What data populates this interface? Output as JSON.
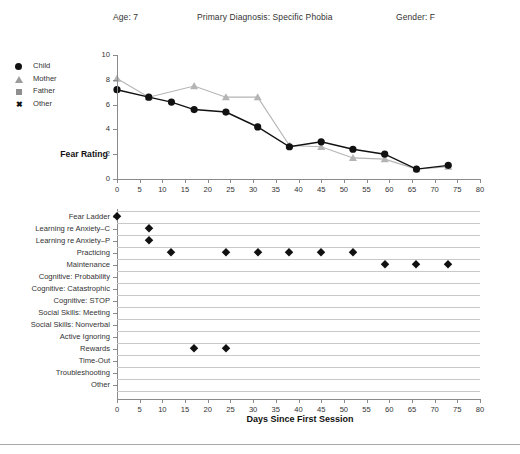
{
  "header": {
    "age": "Age:  7",
    "diagnosis": "Primary Diagnosis:  Specific Phobia",
    "gender": "Gender:  F"
  },
  "legend": {
    "items": [
      {
        "label": "Child",
        "icon": "filled-circle-marker",
        "color": "#111111"
      },
      {
        "label": "Mother",
        "icon": "triangle-marker",
        "color": "#9c9c9c"
      },
      {
        "label": "Father",
        "icon": "square-marker",
        "color": "#8f8f8f"
      },
      {
        "label": "Other",
        "icon": "x-marker",
        "color": "#111111"
      }
    ]
  },
  "chart_data": [
    {
      "type": "line",
      "id": "fear-rating-over-time",
      "title": "",
      "xlabel": "",
      "ylabel": "Fear Rating",
      "xlim": [
        0,
        80
      ],
      "ylim": [
        0,
        10
      ],
      "xticks": [
        0,
        5,
        10,
        15,
        20,
        25,
        30,
        35,
        40,
        45,
        50,
        55,
        60,
        65,
        70,
        75,
        80
      ],
      "yticks": [
        0,
        2,
        4,
        6,
        8,
        10
      ],
      "grid": false,
      "legend_position": "outside-left",
      "series": [
        {
          "name": "Child",
          "marker": "circle",
          "color": "#111111",
          "points": [
            {
              "x": 0,
              "y": 7.2
            },
            {
              "x": 7,
              "y": 6.6
            },
            {
              "x": 12,
              "y": 6.2
            },
            {
              "x": 17,
              "y": 5.6
            },
            {
              "x": 24,
              "y": 5.4
            },
            {
              "x": 31,
              "y": 4.2
            },
            {
              "x": 38,
              "y": 2.6
            },
            {
              "x": 45,
              "y": 3.0
            },
            {
              "x": 52,
              "y": 2.4
            },
            {
              "x": 59,
              "y": 2.0
            },
            {
              "x": 66,
              "y": 0.8
            },
            {
              "x": 73,
              "y": 1.1
            }
          ]
        },
        {
          "name": "Mother",
          "marker": "triangle",
          "color": "#b4b4b4",
          "points": [
            {
              "x": 0,
              "y": 8.1
            },
            {
              "x": 7,
              "y": 6.6
            },
            {
              "x": 17,
              "y": 7.5
            },
            {
              "x": 24,
              "y": 6.6
            },
            {
              "x": 31,
              "y": 6.6
            },
            {
              "x": 38,
              "y": 2.7
            },
            {
              "x": 45,
              "y": 2.6
            },
            {
              "x": 52,
              "y": 1.7
            },
            {
              "x": 59,
              "y": 1.6
            },
            {
              "x": 66,
              "y": 0.8
            },
            {
              "x": 73,
              "y": 1.0
            }
          ]
        }
      ]
    },
    {
      "type": "scatter",
      "id": "treatment-components-timeline",
      "title": "",
      "xlabel": "Days Since First Session",
      "ylabel": "",
      "xlim": [
        0,
        80
      ],
      "xticks": [
        0,
        5,
        10,
        15,
        20,
        25,
        30,
        35,
        40,
        45,
        50,
        55,
        60,
        65,
        70,
        75,
        80
      ],
      "grid": true,
      "categories": [
        "Fear Ladder",
        "Learning re Anxiety–C",
        "Learning re Anxiety–P",
        "Practicing",
        "Maintenance",
        "Cognitive: Probability",
        "Cognitive: Catastrophic",
        "Cognitive: STOP",
        "Social Skills: Meeting",
        "Social Skills: Nonverbal",
        "Active Ignoring",
        "Rewards",
        "Time-Out",
        "Troubleshooting",
        "Other"
      ],
      "points": [
        {
          "category": "Fear Ladder",
          "x": 0
        },
        {
          "category": "Learning re Anxiety–C",
          "x": 7
        },
        {
          "category": "Learning re Anxiety–P",
          "x": 7
        },
        {
          "category": "Practicing",
          "x": 12
        },
        {
          "category": "Practicing",
          "x": 24
        },
        {
          "category": "Practicing",
          "x": 31
        },
        {
          "category": "Practicing",
          "x": 38
        },
        {
          "category": "Practicing",
          "x": 45
        },
        {
          "category": "Practicing",
          "x": 52
        },
        {
          "category": "Maintenance",
          "x": 59
        },
        {
          "category": "Maintenance",
          "x": 66
        },
        {
          "category": "Maintenance",
          "x": 73
        },
        {
          "category": "Rewards",
          "x": 17
        },
        {
          "category": "Rewards",
          "x": 24
        }
      ]
    }
  ]
}
